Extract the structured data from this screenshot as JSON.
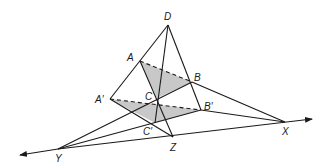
{
  "diagram": {
    "type": "geometry-figure",
    "colors": {
      "stroke": "#1a1a1a",
      "shade": "#c8c8c8",
      "background": "#ffffff"
    },
    "points": {
      "D": {
        "label": "D",
        "x": 168,
        "y": 25
      },
      "A": {
        "label": "A",
        "x": 140,
        "y": 61
      },
      "B": {
        "label": "B",
        "x": 192,
        "y": 82
      },
      "C": {
        "label": "C",
        "x": 157,
        "y": 98
      },
      "A2": {
        "label": "A′",
        "x": 110,
        "y": 99
      },
      "B2": {
        "label": "B′",
        "x": 201,
        "y": 110
      },
      "C2": {
        "label": "C′",
        "x": 155,
        "y": 123
      },
      "X": {
        "label": "X",
        "x": 285,
        "y": 122
      },
      "Y": {
        "label": "Y",
        "x": 58,
        "y": 149
      },
      "Z": {
        "label": "Z",
        "x": 173,
        "y": 137
      }
    },
    "line": {
      "name": "XYZ",
      "arrow_left": [
        20,
        155
      ],
      "arrow_right": [
        312,
        119
      ]
    }
  }
}
